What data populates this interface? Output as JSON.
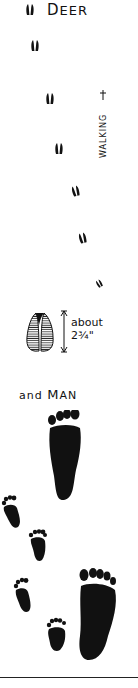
{
  "header": {
    "title_first": "D",
    "title_rest": "EER",
    "icon": "deer-hoof-icon"
  },
  "labels": {
    "walking": "WALKING",
    "size_line1": "about",
    "size_line2": "2¾\"",
    "man_prefix": "and ",
    "man_first": "M",
    "man_rest": "AN"
  },
  "deer_tracks": [
    {
      "x": 35,
      "y": 40
    },
    {
      "x": 48,
      "y": 90
    },
    {
      "x": 57,
      "y": 143
    },
    {
      "x": 75,
      "y": 190
    },
    {
      "x": 81,
      "y": 233
    },
    {
      "x": 96,
      "y": 277
    }
  ],
  "colors": {
    "ink": "#111111",
    "background": "#ffffff"
  }
}
